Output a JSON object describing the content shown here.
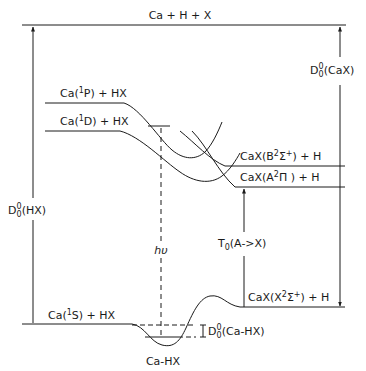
{
  "diagram": {
    "type": "potential energy level diagram",
    "colors": {
      "line": "#1a1a1a",
      "background": "#ffffff"
    },
    "levels": {
      "top": {
        "label": "Ca + H + X"
      },
      "ca_1p": {
        "label": "Ca(¹P) + HX",
        "pre": "Ca(",
        "sup": "1",
        "post": "P) + HX"
      },
      "ca_1d": {
        "label": "Ca(¹D) + HX",
        "pre": "Ca(",
        "sup": "1",
        "post": "D) + HX"
      },
      "ca_1s": {
        "label": "Ca(¹S) + HX",
        "pre": "Ca(",
        "sup": "1",
        "post": "S) + HX"
      },
      "cax_b": {
        "label": "CaX(B²Σ⁺) + H",
        "pre": "CaX(B",
        "sup": "2",
        "mid": "Σ",
        "sup2": "+",
        "post": ") + H"
      },
      "cax_a": {
        "label": "CaX(A²Π) + H",
        "pre": "CaX(A",
        "sup": "2",
        "mid": "Π",
        "post": " ) + H"
      },
      "cax_x": {
        "label": "CaX(X²Σ⁺) + H",
        "pre": "CaX(X",
        "sup": "2",
        "mid": "Σ",
        "sup2": "+",
        "post": ") + H"
      },
      "complex": {
        "label": "Ca-HX"
      }
    },
    "energies": {
      "d_hx": {
        "label": "D₀⁰(HX)",
        "base": "D",
        "sup": "0",
        "sub": "0",
        "post": "(HX)"
      },
      "d_cax": {
        "label": "D₀⁰(CaX)",
        "base": "D",
        "sup": "0",
        "sub": "0",
        "post": "(CaX)"
      },
      "d_cahx": {
        "label": "D₀⁰(Ca-HX)",
        "base": "D",
        "sup": "0",
        "sub": "0",
        "post": "(Ca-HX)"
      },
      "t0": {
        "label": "T₀(A->X)",
        "base": "T",
        "sub": "0",
        "post": "(A->X)"
      },
      "photon": {
        "label": "hυ"
      }
    }
  }
}
